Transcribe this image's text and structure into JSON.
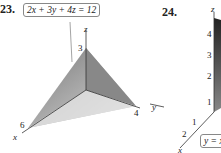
{
  "figures": [
    {
      "number": "23.",
      "equation": "2x + 3y + 4z = 12",
      "axes": {
        "x": "x",
        "y": "y",
        "z": "z"
      },
      "intercepts": {
        "x": "6",
        "y": "4",
        "z": "3"
      }
    },
    {
      "number": "24.",
      "equation": "y = x",
      "axes": {
        "x": "x",
        "y": "y",
        "z": "z"
      },
      "z_ticks": [
        "1",
        "2",
        "3",
        "4"
      ],
      "x_ticks": [
        "1",
        "2"
      ]
    }
  ]
}
